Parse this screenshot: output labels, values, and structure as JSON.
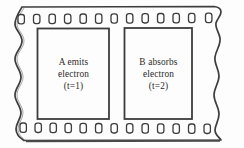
{
  "diagram": {
    "medium": "film-strip",
    "background_color": "#fdfdfd",
    "ink_color": "#3a3a3a",
    "edge_style": "torn-wavy",
    "sprockets": {
      "top_count": 13,
      "bottom_count": 13,
      "shape": "rounded-rectangle"
    },
    "frames": [
      {
        "id": "frame-left",
        "label": "A emits electron (t=1)",
        "lines": [
          "A emits",
          "electron",
          "(t=1)"
        ],
        "subject": "A",
        "action": "emits",
        "object": "electron",
        "time": "t=1"
      },
      {
        "id": "frame-right",
        "label": "B absorbs electron (t=2)",
        "lines": [
          "B absorbs",
          "electron",
          "(t=2)"
        ],
        "subject": "B",
        "action": "absorbs",
        "object": "electron",
        "time": "t=2"
      }
    ]
  }
}
